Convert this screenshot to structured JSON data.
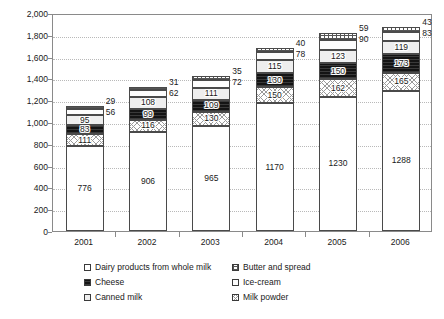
{
  "chart_data": {
    "type": "bar",
    "subtype": "stacked-vertical",
    "title": "",
    "subtitle": "",
    "xlabel": "",
    "ylabel": "",
    "categories": [
      "2001",
      "2002",
      "2003",
      "2004",
      "2005",
      "2006"
    ],
    "ylim": [
      0,
      2000
    ],
    "ytick_labels": [
      "2,000",
      "1,800",
      "1,600",
      "1,400",
      "1,200",
      "1,000",
      "800",
      "600",
      "400",
      "200",
      "0"
    ],
    "ytick_values": [
      2000,
      1800,
      1600,
      1400,
      1200,
      1000,
      800,
      600,
      400,
      200,
      0
    ],
    "ytick_step": 200,
    "grid": true,
    "grid_axis": "y",
    "legend_position": "bottom",
    "legend_columns": 2,
    "stack_order_bottom_to_top": [
      "Dairy products from whole milk",
      "Milk powder",
      "Cheese",
      "Canned milk",
      "Ice-cream",
      "Butter and spread"
    ],
    "series": [
      {
        "name": "Dairy products from whole milk",
        "pattern": "sparse-dots",
        "label_position": "inside",
        "values": [
          776,
          906,
          965,
          1170,
          1230,
          1288
        ]
      },
      {
        "name": "Milk powder",
        "pattern": "cross-hatch",
        "label_position": "inside",
        "values": [
          111,
          116,
          130,
          150,
          162,
          165
        ]
      },
      {
        "name": "Cheese",
        "pattern": "solid-black",
        "label_position": "inside",
        "values": [
          83,
          99,
          109,
          130,
          150,
          173
        ]
      },
      {
        "name": "Canned milk",
        "pattern": "light-grey",
        "label_position": "inside",
        "values": [
          95,
          108,
          111,
          115,
          123,
          119
        ]
      },
      {
        "name": "Ice-cream",
        "pattern": "white",
        "label_position": "outside-right",
        "values": [
          56,
          62,
          72,
          78,
          90,
          83
        ]
      },
      {
        "name": "Butter and spread",
        "pattern": "checker",
        "label_position": "outside-right",
        "values": [
          29,
          31,
          35,
          40,
          59,
          43
        ]
      }
    ],
    "totals": [
      1150,
      1322,
      1422,
      1683,
      1814,
      1871
    ]
  },
  "legend": {
    "items": [
      {
        "label": "Dairy products from whole milk",
        "swatch": "sparse-dots"
      },
      {
        "label": "Butter and spread",
        "swatch": "checker"
      },
      {
        "label": "Cheese",
        "swatch": "solid-black"
      },
      {
        "label": "Ice-cream",
        "swatch": "white"
      },
      {
        "label": "Canned milk",
        "swatch": "light-grey"
      },
      {
        "label": "Milk powder",
        "swatch": "cross-hatch"
      }
    ]
  },
  "colors": {
    "axis": "#8a8a8a",
    "grid": "#b9b9b9",
    "text": "#1a1a1a",
    "cheese_fill": "#141414",
    "background": "#ffffff"
  }
}
